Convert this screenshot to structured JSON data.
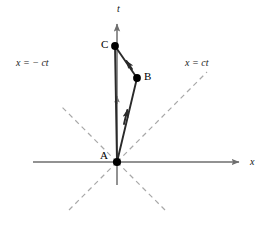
{
  "figure": {
    "width": 268,
    "height": 227,
    "background": "#ffffff"
  },
  "colors": {
    "axis": "#6e6e6e",
    "lightcone": "#a8a8a8",
    "worldline": "#2a2a2a",
    "point": "#000000",
    "text": "#111111"
  },
  "axes": {
    "origin": {
      "x": 117,
      "y": 162
    },
    "t_axis": {
      "label": "t",
      "label_style": "italic",
      "x": 117,
      "top_y": 18,
      "bottom_y": 185,
      "arrow": "up",
      "tick_arrow_y": 95
    },
    "x_axis": {
      "label": "x",
      "label_style": "italic",
      "y": 162,
      "left_x": 33,
      "right_x": 245,
      "arrow": "right"
    }
  },
  "light_cone": {
    "right_label": "x = ct",
    "left_label": "x = − ct",
    "style": "dashed",
    "slope_degrees": 45,
    "lines": [
      {
        "name": "upper-right",
        "x1": 117,
        "y1": 162,
        "x2": 207,
        "y2": 72
      },
      {
        "name": "upper-left",
        "x1": 117,
        "y1": 162,
        "x2": 60,
        "y2": 105
      },
      {
        "name": "lower-right",
        "x1": 117,
        "y1": 162,
        "x2": 165,
        "y2": 210
      },
      {
        "name": "lower-left",
        "x1": 117,
        "y1": 162,
        "x2": 69,
        "y2": 210
      }
    ]
  },
  "events": [
    {
      "id": "A",
      "label": "A",
      "x": 117,
      "y": 162,
      "description": "origin event"
    },
    {
      "id": "B",
      "label": "B",
      "x": 137,
      "y": 78,
      "description": "turnaround event"
    },
    {
      "id": "C",
      "label": "C",
      "x": 115,
      "y": 46,
      "description": "reunion event on t axis"
    }
  ],
  "worldlines": [
    {
      "name": "A-to-B",
      "from": "A",
      "to": "B",
      "arrow": "to-B",
      "arrow_at": {
        "x": 128,
        "y": 113
      }
    },
    {
      "name": "B-to-C",
      "from": "B",
      "to": "C",
      "arrow": "to-C",
      "arrow_at": {
        "x": 127,
        "y": 61
      }
    },
    {
      "name": "C-to-A",
      "from": "C",
      "to": "A",
      "arrow": "none"
    }
  ]
}
